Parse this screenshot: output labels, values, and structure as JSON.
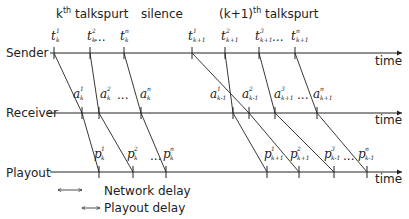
{
  "headers": {
    "kth_talkspurt": {
      "base": "k",
      "sup": "th",
      "rest": " talkspurt"
    },
    "silence": "silence",
    "k1th_talkspurt": {
      "base": "(k+1)",
      "sup": "th",
      "rest": " talkspurt"
    }
  },
  "rows": {
    "sender": "Sender",
    "receiver": "Receiver",
    "playout": "Playout",
    "time": "time"
  },
  "sender_labels": [
    {
      "base": "t",
      "sup": "1",
      "sub": "k"
    },
    {
      "base": "t",
      "sup": "2",
      "sub": "k"
    },
    {
      "base": "t",
      "sup": "n",
      "sub": "k"
    },
    {
      "base": "t",
      "sup": "1",
      "sub": "k+1"
    },
    {
      "base": "t",
      "sup": "2",
      "sub": "k+1"
    },
    {
      "base": "t",
      "sup": "3",
      "sub": "k+1"
    },
    {
      "base": "t",
      "sup": "n",
      "sub": "k+1"
    }
  ],
  "receiver_labels": [
    {
      "base": "a",
      "sup": "1",
      "sub": "k"
    },
    {
      "base": "a",
      "sup": "2",
      "sub": "k"
    },
    {
      "base": "a",
      "sup": "n",
      "sub": "k"
    },
    {
      "base": "a",
      "sup": "1",
      "sub": "k-1"
    },
    {
      "base": "a",
      "sup": "2",
      "sub": "k-1"
    },
    {
      "base": "a",
      "sup": "3",
      "sub": "k+1"
    },
    {
      "base": "a",
      "sup": "n",
      "sub": "k+1"
    }
  ],
  "playout_labels": [
    {
      "base": "p",
      "sup": "1",
      "sub": "k"
    },
    {
      "base": "p",
      "sup": "2",
      "sub": "k"
    },
    {
      "base": "p",
      "sup": "n",
      "sub": "k"
    },
    {
      "base": "p",
      "sup": "1",
      "sub": "k+1"
    },
    {
      "base": "p",
      "sup": "2",
      "sub": "k+1"
    },
    {
      "base": "p",
      "sup": "3",
      "sub": "k-1"
    },
    {
      "base": "p",
      "sup": "n",
      "sub": "k-1"
    }
  ],
  "ellipsis": "...",
  "legend": {
    "network_delay": "Network delay",
    "playout_delay": "Playout delay"
  }
}
